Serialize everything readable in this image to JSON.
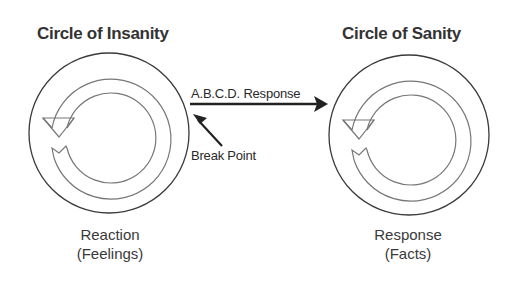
{
  "diagram": {
    "left": {
      "title": "Circle of Insanity",
      "caption_line1": "Reaction",
      "caption_line2": "(Feelings)"
    },
    "right": {
      "title": "Circle of Sanity",
      "caption_line1": "Response",
      "caption_line2": "(Facts)"
    },
    "connector": {
      "label": "A.B.C.D. Response",
      "break_label": "Break Point"
    },
    "colors": {
      "stroke": "#444444",
      "arrow_fill": "#222222",
      "inner_stroke": "#777777"
    }
  }
}
